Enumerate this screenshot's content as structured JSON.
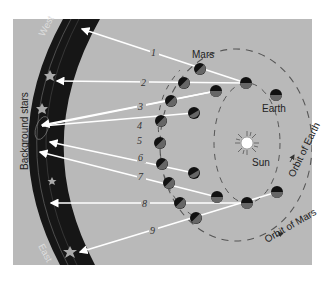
{
  "figure": {
    "panel_color": "#b9b9b9",
    "band_color": "#161616",
    "line_color": "#ffffff",
    "labels": {
      "west": "West",
      "east": "East",
      "background_stars": "Background stars",
      "mars": "Mars",
      "earth": "Earth",
      "sun": "Sun",
      "orbit_of_earth": "Orbit of Earth",
      "orbit_of_mars": "Orbit of Mars"
    },
    "sightlines": [
      {
        "n": "1",
        "earth": [
          246,
          83
        ],
        "mars": [
          200,
          69
        ],
        "star": [
          80,
          29
        ],
        "label_pos": [
          154,
          54
        ]
      },
      {
        "n": "2",
        "earth": [
          246,
          83
        ],
        "mars": [
          184,
          83
        ],
        "star": [
          55,
          81
        ],
        "label_pos": [
          144,
          84
        ]
      },
      {
        "n": "3",
        "earth": [
          216,
          91
        ],
        "mars": [
          171,
          101
        ],
        "star": [
          40,
          125
        ],
        "label_pos": [
          141,
          108
        ]
      },
      {
        "n": "4",
        "earth": [
          216,
          91
        ],
        "mars": [
          161,
          121
        ],
        "star": [
          40,
          125
        ],
        "label_pos": [
          140,
          127
        ]
      },
      {
        "n": "5",
        "earth": [
          194,
          113
        ],
        "mars": [
          160,
          143
        ],
        "star": [
          40,
          125
        ],
        "label_pos": [
          140,
          142
        ]
      },
      {
        "n": "6",
        "earth": [
          194,
          173
        ],
        "mars": [
          162,
          164
        ],
        "star": [
          48,
          142
        ],
        "label_pos": [
          141,
          159
        ]
      },
      {
        "n": "7",
        "earth": [
          217,
          197
        ],
        "mars": [
          169,
          183
        ],
        "star": [
          38,
          152
        ],
        "label_pos": [
          141,
          178
        ]
      },
      {
        "n": "8",
        "earth": [
          247,
          203
        ],
        "mars": [
          180,
          203
        ],
        "star": [
          49,
          203
        ],
        "label_pos": [
          145,
          205
        ]
      },
      {
        "n": "9",
        "earth": [
          277,
          192
        ],
        "mars": [
          196,
          218
        ],
        "star": [
          78,
          253
        ],
        "label_pos": [
          153,
          232
        ]
      }
    ]
  }
}
